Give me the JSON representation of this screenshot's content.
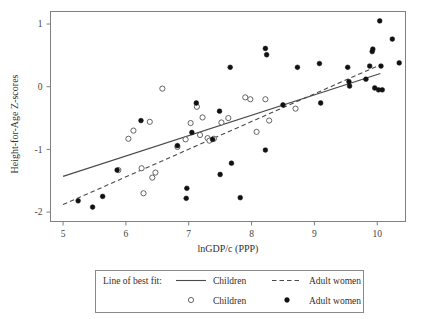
{
  "chart_data": {
    "type": "scatter",
    "title": "",
    "xlabel": "lnGDP/c (PPP)",
    "ylabel": "Height-for-Age Z-scores",
    "xlim": [
      4.8,
      10.45
    ],
    "ylim": [
      -2.15,
      1.2
    ],
    "xticks": [
      5,
      6,
      7,
      8,
      9,
      10
    ],
    "yticks": [
      1,
      0,
      -1,
      -2
    ],
    "grid": false,
    "legend_position": "below-axes",
    "legend": {
      "line_group_label": "Line of best fit:",
      "entries": [
        {
          "marker": "solid-line",
          "label": "Children"
        },
        {
          "marker": "dashed-line",
          "label": "Adult women"
        },
        {
          "marker": "open-circle",
          "label": "Children"
        },
        {
          "marker": "filled-circle",
          "label": "Adult women"
        }
      ]
    },
    "series": [
      {
        "name": "Children",
        "marker": "open-circle",
        "color": "#555555",
        "points": [
          [
            6.04,
            -0.83
          ],
          [
            6.12,
            -0.7
          ],
          [
            6.38,
            -0.56
          ],
          [
            6.58,
            -0.03
          ],
          [
            6.25,
            -1.3
          ],
          [
            6.28,
            -1.7
          ],
          [
            6.47,
            -1.37
          ],
          [
            6.42,
            -1.45
          ],
          [
            6.82,
            -0.96
          ],
          [
            6.95,
            -0.84
          ],
          [
            7.03,
            -0.58
          ],
          [
            7.13,
            -0.32
          ],
          [
            7.18,
            -0.77
          ],
          [
            7.3,
            -0.82
          ],
          [
            7.33,
            -0.86
          ],
          [
            7.4,
            -0.83
          ],
          [
            7.52,
            -0.57
          ],
          [
            7.63,
            -0.5
          ],
          [
            7.9,
            -0.17
          ],
          [
            7.98,
            -0.2
          ],
          [
            8.22,
            -0.2
          ],
          [
            8.08,
            -0.72
          ],
          [
            8.28,
            -0.54
          ],
          [
            8.7,
            -0.35
          ],
          [
            5.88,
            -1.33
          ],
          [
            7.22,
            -0.49
          ]
        ]
      },
      {
        "name": "Adult women",
        "marker": "filled-circle",
        "color": "#111111",
        "points": [
          [
            5.24,
            -1.82
          ],
          [
            5.47,
            -1.92
          ],
          [
            5.63,
            -1.75
          ],
          [
            5.86,
            -1.33
          ],
          [
            6.24,
            -0.54
          ],
          [
            6.82,
            -0.94
          ],
          [
            6.96,
            -1.78
          ],
          [
            6.97,
            -1.62
          ],
          [
            7.05,
            -0.73
          ],
          [
            7.12,
            -0.26
          ],
          [
            7.38,
            -0.84
          ],
          [
            7.49,
            -0.39
          ],
          [
            7.5,
            -1.4
          ],
          [
            7.66,
            0.31
          ],
          [
            7.68,
            -1.22
          ],
          [
            7.82,
            -1.77
          ],
          [
            8.22,
            0.61
          ],
          [
            8.24,
            0.51
          ],
          [
            8.22,
            -1.01
          ],
          [
            8.5,
            -0.29
          ],
          [
            8.73,
            0.31
          ],
          [
            9.08,
            0.37
          ],
          [
            9.1,
            -0.26
          ],
          [
            9.53,
            0.31
          ],
          [
            9.55,
            0.08
          ],
          [
            9.56,
            0.01
          ],
          [
            9.82,
            0.12
          ],
          [
            9.88,
            0.33
          ],
          [
            9.92,
            0.56
          ],
          [
            9.93,
            0.6
          ],
          [
            9.96,
            -0.02
          ],
          [
            10.02,
            -0.05
          ],
          [
            10.04,
            1.05
          ],
          [
            10.06,
            0.33
          ],
          [
            10.08,
            -0.05
          ],
          [
            10.24,
            0.76
          ],
          [
            10.35,
            0.38
          ]
        ]
      }
    ],
    "fit_lines": [
      {
        "name": "Children",
        "style": "solid",
        "x_start": 5.0,
        "y_start": -1.43,
        "x_end": 10.05,
        "y_end": 0.21
      },
      {
        "name": "Adult women",
        "style": "dashed",
        "x_start": 5.0,
        "y_start": -1.88,
        "x_end": 10.05,
        "y_end": 0.35
      }
    ]
  }
}
